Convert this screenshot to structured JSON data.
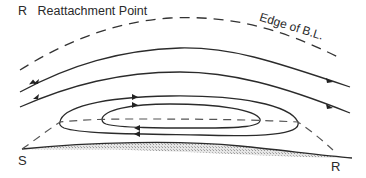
{
  "diagram": {
    "legend": {
      "symbol": "R",
      "text": "Reattachment Point"
    },
    "labels": {
      "edge_of_bl": "Edge of B.L.",
      "separation_point": "S",
      "reattachment_point": "R"
    },
    "elements": [
      {
        "type": "dashed-curve",
        "name": "edge-of-boundary-layer"
      },
      {
        "type": "streamline",
        "name": "outer-streamline-1",
        "direction": "left-to-right"
      },
      {
        "type": "streamline",
        "name": "outer-streamline-2",
        "direction": "left-to-right"
      },
      {
        "type": "closed-streamline",
        "name": "outer-recirculation-loop"
      },
      {
        "type": "closed-streamline",
        "name": "inner-recirculation-loop"
      },
      {
        "type": "dashed-curve",
        "name": "dividing-streamline"
      },
      {
        "type": "surface",
        "name": "wall-surface",
        "fill": "hatched"
      }
    ],
    "colors": {
      "line": "#2b2b2b",
      "surface_fill": "#cfcfcf",
      "background": "#ffffff"
    }
  }
}
